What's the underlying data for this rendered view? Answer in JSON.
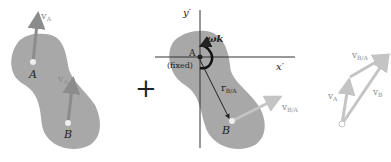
{
  "panel_left": {
    "points": [
      {
        "label": "A",
        "velocity_label": "v",
        "velocity_sub": "A"
      },
      {
        "label": "B",
        "velocity_label": "v",
        "velocity_sub": "A"
      }
    ]
  },
  "operator": "+",
  "panel_middle": {
    "axis_x": "x′",
    "axis_y": "y′",
    "point_a_label": "A",
    "fixed_label": "(fixed)",
    "omega_label": "ωk",
    "position_label": "r",
    "position_sub": "B/A",
    "point_b_label": "B",
    "relative_velocity_label": "v",
    "relative_velocity_sub": "B/A"
  },
  "panel_right": {
    "vectors": [
      {
        "label": "v",
        "sub": "A"
      },
      {
        "label": "v",
        "sub": "B/A"
      },
      {
        "label": "v",
        "sub": "B"
      }
    ]
  },
  "colors": {
    "body_fill": "#a8a8a8",
    "arrow_gray": "#8c8c8c",
    "light_arrow": "#c4c4c4",
    "ink": "#222222"
  }
}
